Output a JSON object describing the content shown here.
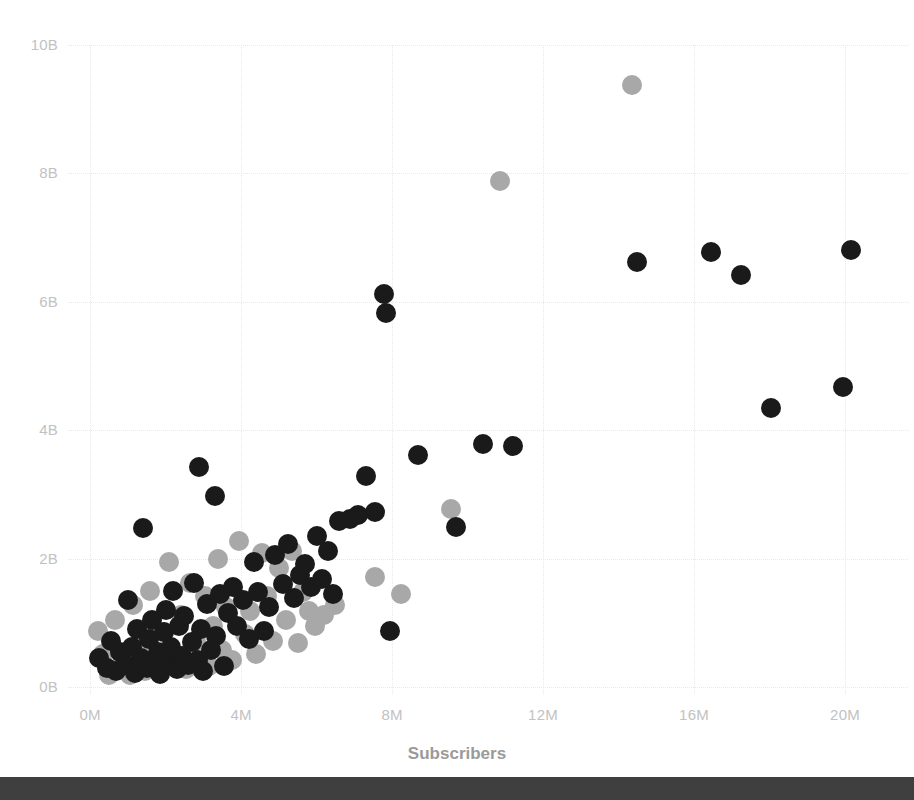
{
  "axes": {
    "x_title": "Subscribers",
    "y_title": "",
    "x_ticks": [
      "0M",
      "4M",
      "8M",
      "12M",
      "16M",
      "20M"
    ],
    "y_ticks": [
      "0B",
      "2B",
      "4B",
      "6B",
      "8B",
      "10B"
    ]
  },
  "colors": {
    "series_dark": "#1a1a1a",
    "series_light": "#a8a8a8",
    "gridline": "#e9e9e9",
    "tick_text": "#c2c2c2",
    "axis_title": "#9a9a9a",
    "background": "#ffffff",
    "bottom_bar": "#3f3f3f"
  },
  "chart_data": {
    "type": "scatter",
    "title": "",
    "xlabel": "Subscribers",
    "ylabel": "",
    "xlim": [
      0,
      21.5
    ],
    "ylim": [
      0,
      10.4
    ],
    "x_unit": "M",
    "y_unit": "B",
    "grid": true,
    "legend_position": "none",
    "x_ticks": [
      0,
      4,
      8,
      12,
      16,
      20
    ],
    "y_ticks": [
      0,
      2,
      4,
      6,
      8,
      10
    ],
    "series": [
      {
        "name": "dark",
        "color": "#1a1a1a",
        "points": [
          [
            0.25,
            0.45
          ],
          [
            0.45,
            0.3
          ],
          [
            0.55,
            0.72
          ],
          [
            0.7,
            0.25
          ],
          [
            0.8,
            0.55
          ],
          [
            0.95,
            0.35
          ],
          [
            1.0,
            1.35
          ],
          [
            1.1,
            0.62
          ],
          [
            1.2,
            0.22
          ],
          [
            1.25,
            0.9
          ],
          [
            1.35,
            0.45
          ],
          [
            1.4,
            2.48
          ],
          [
            1.5,
            0.3
          ],
          [
            1.55,
            0.75
          ],
          [
            1.65,
            1.05
          ],
          [
            1.7,
            0.4
          ],
          [
            1.8,
            0.55
          ],
          [
            1.85,
            0.2
          ],
          [
            1.95,
            0.85
          ],
          [
            2.0,
            1.2
          ],
          [
            2.05,
            0.38
          ],
          [
            2.15,
            0.62
          ],
          [
            2.2,
            1.5
          ],
          [
            2.3,
            0.28
          ],
          [
            2.35,
            0.95
          ],
          [
            2.45,
            0.48
          ],
          [
            2.5,
            1.1
          ],
          [
            2.6,
            0.35
          ],
          [
            2.7,
            0.7
          ],
          [
            2.75,
            1.62
          ],
          [
            2.85,
            0.42
          ],
          [
            2.9,
            3.42
          ],
          [
            2.95,
            0.9
          ],
          [
            3.0,
            0.25
          ],
          [
            3.1,
            1.3
          ],
          [
            3.2,
            0.58
          ],
          [
            3.3,
            2.98
          ],
          [
            3.35,
            0.8
          ],
          [
            3.45,
            1.45
          ],
          [
            3.55,
            0.33
          ],
          [
            3.65,
            1.15
          ],
          [
            3.8,
            1.55
          ],
          [
            3.9,
            0.95
          ],
          [
            4.05,
            1.35
          ],
          [
            4.2,
            0.75
          ],
          [
            4.35,
            1.95
          ],
          [
            4.45,
            1.48
          ],
          [
            4.6,
            0.88
          ],
          [
            4.75,
            1.25
          ],
          [
            4.9,
            2.05
          ],
          [
            5.1,
            1.6
          ],
          [
            5.25,
            2.22
          ],
          [
            5.4,
            1.38
          ],
          [
            5.55,
            1.75
          ],
          [
            5.7,
            1.92
          ],
          [
            5.85,
            1.55
          ],
          [
            6.0,
            2.35
          ],
          [
            6.15,
            1.68
          ],
          [
            6.3,
            2.12
          ],
          [
            6.45,
            1.45
          ],
          [
            6.6,
            2.58
          ],
          [
            6.9,
            2.62
          ],
          [
            7.1,
            2.68
          ],
          [
            7.3,
            3.28
          ],
          [
            7.55,
            2.72
          ],
          [
            7.8,
            6.12
          ],
          [
            7.85,
            5.82
          ],
          [
            7.95,
            0.88
          ],
          [
            8.7,
            3.62
          ],
          [
            9.7,
            2.5
          ],
          [
            10.4,
            3.78
          ],
          [
            11.2,
            3.75
          ],
          [
            14.5,
            6.62
          ],
          [
            16.45,
            6.78
          ],
          [
            17.25,
            6.42
          ],
          [
            18.05,
            4.35
          ],
          [
            19.95,
            4.68
          ],
          [
            20.15,
            6.8
          ]
        ]
      },
      {
        "name": "light",
        "color": "#a8a8a8",
        "points": [
          [
            0.2,
            0.88
          ],
          [
            0.35,
            0.52
          ],
          [
            0.5,
            0.18
          ],
          [
            0.65,
            1.05
          ],
          [
            0.85,
            0.38
          ],
          [
            1.05,
            0.18
          ],
          [
            1.15,
            1.28
          ],
          [
            1.3,
            0.62
          ],
          [
            1.45,
            0.25
          ],
          [
            1.6,
            1.5
          ],
          [
            1.75,
            0.35
          ],
          [
            1.9,
            0.85
          ],
          [
            2.1,
            1.95
          ],
          [
            2.25,
            0.45
          ],
          [
            2.4,
            1.12
          ],
          [
            2.55,
            0.28
          ],
          [
            2.65,
            1.62
          ],
          [
            2.8,
            0.72
          ],
          [
            3.05,
            1.42
          ],
          [
            3.15,
            0.32
          ],
          [
            3.25,
            0.95
          ],
          [
            3.4,
            2.0
          ],
          [
            3.5,
            0.58
          ],
          [
            3.6,
            1.25
          ],
          [
            3.75,
            0.42
          ],
          [
            3.95,
            2.28
          ],
          [
            4.1,
            0.82
          ],
          [
            4.25,
            1.18
          ],
          [
            4.4,
            0.52
          ],
          [
            4.55,
            2.08
          ],
          [
            4.7,
            1.42
          ],
          [
            4.85,
            0.72
          ],
          [
            5.0,
            1.85
          ],
          [
            5.2,
            1.05
          ],
          [
            5.35,
            2.12
          ],
          [
            5.5,
            0.68
          ],
          [
            5.65,
            1.48
          ],
          [
            5.8,
            1.18
          ],
          [
            5.95,
            0.95
          ],
          [
            6.2,
            1.12
          ],
          [
            6.5,
            1.28
          ],
          [
            7.55,
            1.72
          ],
          [
            8.25,
            1.45
          ],
          [
            9.55,
            2.78
          ],
          [
            10.85,
            7.88
          ],
          [
            14.35,
            9.38
          ]
        ]
      }
    ]
  }
}
